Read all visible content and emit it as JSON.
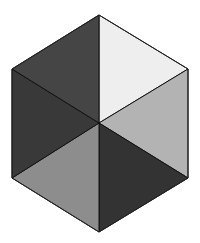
{
  "figure": {
    "shape": "hexagon divided into six triangles",
    "center": [
      99,
      123
    ],
    "vertices": {
      "top": [
        99,
        15
      ],
      "upper_right": [
        188,
        69
      ],
      "lower_right": [
        188,
        178
      ],
      "bottom": [
        99,
        232
      ],
      "lower_left": [
        12,
        178
      ],
      "upper_left": [
        12,
        69
      ]
    },
    "triangles": [
      {
        "name": "top-right",
        "fill": "#eeeeee"
      },
      {
        "name": "right",
        "fill": "#b3b3b3"
      },
      {
        "name": "bottom-right",
        "fill": "#333333"
      },
      {
        "name": "bottom-left",
        "fill": "#8d8d8d"
      },
      {
        "name": "left",
        "fill": "#393939"
      },
      {
        "name": "top-left",
        "fill": "#454545"
      }
    ],
    "stroke": "#111111"
  }
}
